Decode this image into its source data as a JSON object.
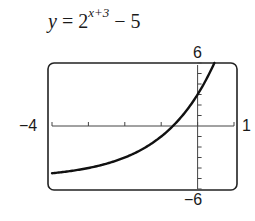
{
  "title": {
    "y_var": "y",
    "equals": " = 2",
    "exponent": "x+3",
    "tail": " − 5"
  },
  "labels": {
    "ymax": "6",
    "ymin": "−6",
    "xmin": "−4",
    "xmax": "1"
  },
  "chart_data": {
    "type": "line",
    "xlabel": "",
    "ylabel": "",
    "xlim": [
      -4,
      1
    ],
    "ylim": [
      -6,
      6
    ],
    "x_ticks": [
      -4,
      -3,
      -2,
      -1,
      0,
      1
    ],
    "y_ticks": [
      -6,
      -5,
      -4,
      -3,
      -2,
      -1,
      0,
      1,
      2,
      3,
      4,
      5,
      6
    ],
    "grid": false,
    "legend": null,
    "series": [
      {
        "name": "y = 2^(x+3) − 5",
        "x": [
          -4,
          -3.5,
          -3,
          -2.5,
          -2,
          -1.5,
          -1,
          -0.68,
          -0.5,
          0,
          0.25,
          0.46
        ],
        "y": [
          -4.5,
          -4.29,
          -4,
          -3.59,
          -3,
          -2.17,
          -1,
          0,
          0.66,
          3,
          4.51,
          6
        ]
      }
    ],
    "colors": {
      "curve": "#111111",
      "frame": "#222222",
      "axes": "#444444"
    }
  }
}
